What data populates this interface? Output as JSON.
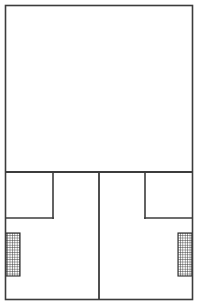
{
  "drawing": {
    "kind": "architectural-floor-plan-line-drawing",
    "canvas": {
      "width": 199,
      "height": 306,
      "background": "#ffffff"
    },
    "ink_color": "#3c3c3c",
    "hatch_color": "#2a2a2a",
    "labels": {
      "title": "",
      "caption": "",
      "annotations": []
    },
    "frame": {
      "name": "outer-wall",
      "x": 5.5,
      "y": 5.5,
      "width": 187,
      "height": 294,
      "stroke_width": 1.6
    },
    "partitions": [
      {
        "name": "main-horizontal-partition",
        "orientation": "horizontal",
        "x1": 5,
        "y1": 172,
        "x2": 193,
        "y2": 172,
        "stroke_width": 1.8
      },
      {
        "name": "center-vertical-partition",
        "orientation": "vertical",
        "x1": 99,
        "y1": 172,
        "x2": 99,
        "y2": 300,
        "stroke_width": 1.8
      },
      {
        "name": "left-room-vertical-wall",
        "orientation": "vertical",
        "x1": 53,
        "y1": 172,
        "x2": 53,
        "y2": 219,
        "stroke_width": 1.6
      },
      {
        "name": "left-room-horizontal-wall",
        "orientation": "horizontal",
        "x1": 5,
        "y1": 218,
        "x2": 54,
        "y2": 218,
        "stroke_width": 1.6
      },
      {
        "name": "right-room-vertical-wall",
        "orientation": "vertical",
        "x1": 145,
        "y1": 172,
        "x2": 145,
        "y2": 219,
        "stroke_width": 1.6
      },
      {
        "name": "right-room-horizontal-wall",
        "orientation": "horizontal",
        "x1": 144,
        "y1": 218,
        "x2": 193,
        "y2": 218,
        "stroke_width": 1.6
      }
    ],
    "hatched_blocks": [
      {
        "name": "left-hatched-block",
        "x": 6,
        "y": 233,
        "width": 14,
        "height": 43,
        "pattern": "crosshatch-grid",
        "pattern_pitch": 2.4,
        "stroke_width": 0.55,
        "outline_width": 1.1
      },
      {
        "name": "right-hatched-block",
        "x": 178,
        "y": 233,
        "width": 14,
        "height": 43,
        "pattern": "crosshatch-grid",
        "pattern_pitch": 2.4,
        "stroke_width": 0.55,
        "outline_width": 1.1
      }
    ],
    "regions": [
      {
        "name": "upper-large-region",
        "x": 5,
        "y": 5,
        "width": 188,
        "height": 167
      },
      {
        "name": "lower-left-region",
        "x": 5,
        "y": 172,
        "width": 94,
        "height": 128
      },
      {
        "name": "lower-right-region",
        "x": 99,
        "y": 172,
        "width": 94,
        "height": 128
      },
      {
        "name": "left-small-room",
        "x": 5,
        "y": 172,
        "width": 48,
        "height": 46
      },
      {
        "name": "right-small-room",
        "x": 145,
        "y": 172,
        "width": 48,
        "height": 46
      }
    ]
  }
}
